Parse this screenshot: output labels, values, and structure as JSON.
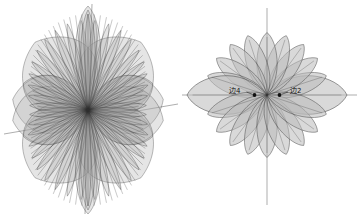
{
  "figure": {
    "title": "",
    "background_color": "#ffffff",
    "panels": [
      {
        "id": "left-panel",
        "name": "dense-superposed-polar-rose",
        "center": {
          "x": 88,
          "y": 110
        },
        "axes": {
          "vertical": {
            "visible": true,
            "tilt_deg": 2,
            "extends_above": true
          },
          "horizontal": {
            "visible": true,
            "tilt_deg": -6,
            "extends_right": true
          }
        },
        "annotations": []
      },
      {
        "id": "right-panel",
        "name": "twenty-petal-polar-rose",
        "center": {
          "x": 267,
          "y": 110
        },
        "axes": {
          "vertical": {
            "visible": true,
            "tilt_deg": 0,
            "extends_above": true
          },
          "horizontal": {
            "visible": true,
            "tilt_deg": 0,
            "extends_right": true
          }
        },
        "annotations": [
          {
            "label": "边4",
            "target_angle_deg": 180,
            "side": "left"
          },
          {
            "label": "边2",
            "target_angle_deg": 0,
            "side": "right"
          }
        ]
      }
    ],
    "colors": {
      "petal_fill": "#b9b9b9",
      "petal_stroke": "#4a4a4a",
      "axis": "#777777",
      "label": "#101010",
      "marker": "#111111"
    }
  },
  "chart_data": {
    "type": "line",
    "title": "",
    "subtitle": "",
    "xlabel": "",
    "ylabel": "",
    "layout": "two polar plots side by side, shared white background",
    "grid": false,
    "legend_position": "none",
    "plots": [
      {
        "name": "left-polar-pattern",
        "coordinate_system": "polar",
        "description": "Dense superposition of many rose curves r = cos(k*theta) producing overlapping lobes; outer envelope is four broad quadrant lobes with tall narrow vertical spikes and hatched side lobes.",
        "theta_units": "degrees",
        "theta_range": [
          0,
          360
        ],
        "r_range": [
          0,
          1
        ],
        "series": [
          {
            "name": "envelope-main-lobes",
            "petals": 4,
            "petal_half_width_deg": 42,
            "r_max": 1.0
          },
          {
            "name": "vertical-spike-pair",
            "petals": 2,
            "petal_half_width_deg": 5,
            "r_max": 1.0,
            "orientation_deg": [
              90,
              270
            ]
          },
          {
            "name": "fine-structure-rays",
            "petals": 40,
            "petal_half_width_deg": 3,
            "r_max": 0.92
          },
          {
            "name": "hatched-side-lobes",
            "petals": 4,
            "petal_half_width_deg": 16,
            "r_max": 0.78,
            "orientation_deg": [
              150,
              210,
              330,
              30
            ]
          }
        ]
      },
      {
        "name": "right-polar-pattern",
        "coordinate_system": "polar",
        "description": "Clean 20-petal rose; petals evenly spaced every 18 degrees; the two horizontal petals at 0 and 180 degrees are elongated (main lobes).",
        "theta_units": "degrees",
        "theta_range": [
          0,
          360
        ],
        "r_range": [
          0,
          1
        ],
        "petal_count": 20,
        "petal_spacing_deg": 18,
        "main_lobe_angles_deg": [
          0,
          180
        ],
        "main_lobe_r": 1.0,
        "side_lobe_r": 0.78,
        "series": [
          {
            "name": "rose-petals",
            "values": [
              1.0,
              0.78,
              0.78,
              0.78,
              0.78,
              0.78,
              0.78,
              0.78,
              0.78,
              0.78,
              1.0,
              0.78,
              0.78,
              0.78,
              0.78,
              0.78,
              0.78,
              0.78,
              0.78,
              0.78
            ]
          }
        ],
        "angles_deg": [
          0,
          18,
          36,
          54,
          72,
          90,
          108,
          126,
          144,
          162,
          180,
          198,
          216,
          234,
          252,
          270,
          288,
          306,
          324,
          342
        ],
        "annotations": [
          {
            "text": "边4",
            "at_angle_deg": 180,
            "at_r": 0.13
          },
          {
            "text": "边2",
            "at_angle_deg": 0,
            "at_r": 0.13
          }
        ]
      }
    ]
  }
}
